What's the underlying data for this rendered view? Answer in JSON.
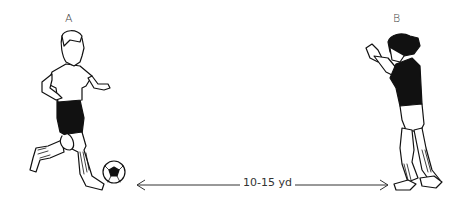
{
  "diagram": {
    "player_a": {
      "label": "A",
      "role": "passer with ball"
    },
    "player_b": {
      "label": "B",
      "role": "receiver, hands raised"
    },
    "distance": {
      "label": "10-15 yd"
    },
    "colors": {
      "line": "#111111",
      "background": "#ffffff",
      "fill_dark": "#111111"
    }
  }
}
